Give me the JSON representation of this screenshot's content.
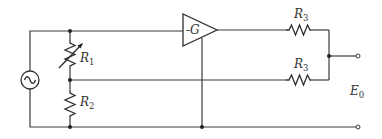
{
  "diagram": {
    "type": "circuit-schematic",
    "components": {
      "source": {
        "kind": "ac-voltage-source",
        "symbol": "~"
      },
      "r1": {
        "kind": "variable-resistor",
        "label": "R",
        "subscript": "1"
      },
      "r2": {
        "kind": "resistor",
        "label": "R",
        "subscript": "2"
      },
      "amplifier": {
        "kind": "inverting-amplifier",
        "label": "-G"
      },
      "r3_top": {
        "kind": "resistor",
        "label": "R",
        "subscript": "3"
      },
      "r3_bottom": {
        "kind": "resistor",
        "label": "R",
        "subscript": "3"
      },
      "output": {
        "kind": "output-terminals",
        "label": "E",
        "subscript": "0"
      }
    },
    "colors": {
      "wire": "#3a3a3a",
      "background": "#ffffff"
    }
  }
}
